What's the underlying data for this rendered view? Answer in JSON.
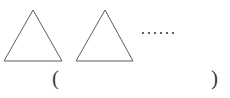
{
  "figure": {
    "background_color": "#ffffff",
    "stroke_color": "#5d5d5d",
    "text_color": "#3a3a3a",
    "width": 230,
    "height": 98,
    "shapes": [
      {
        "name": "triangle-1",
        "type": "triangle",
        "points": "33,10 62,61 4,61",
        "apex_x": 33,
        "apex_y": 10,
        "base_left_x": 4,
        "base_right_x": 62,
        "base_y": 61
      },
      {
        "name": "triangle-2",
        "type": "triangle",
        "points": "105,10 133,61 76,61",
        "apex_x": 105,
        "apex_y": 10,
        "base_left_x": 76,
        "base_right_x": 133,
        "base_y": 61
      }
    ],
    "ellipsis": {
      "name": "ellipsis-dots",
      "dot_count": 6,
      "dot_radius": 1.1,
      "start_x": 143,
      "spacing": 6,
      "y": 33,
      "text": "······"
    },
    "answer": {
      "open_paren": "(",
      "close_paren": ")",
      "value": ""
    }
  }
}
